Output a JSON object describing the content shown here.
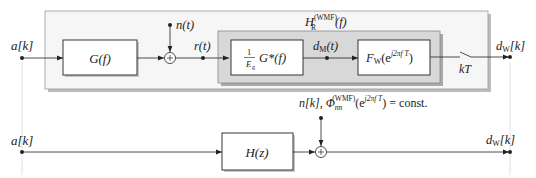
{
  "colors": {
    "line": "#222222",
    "outer_fill": "#f6f6f6",
    "outer_shadow": "#bdbdbd",
    "inner_fill": "#d8d8d8",
    "inner_shadow": "#a9a9a9",
    "block_fill": "#ffffff",
    "guide": "#e4e4e4"
  },
  "top": {
    "input_label": "a[k]",
    "g_block": "G(f)",
    "noise_label": "n(t)",
    "r_label": "r(t)",
    "mf_block": {
      "frac_num": "1",
      "frac_den": "E",
      "frac_den_sub": "g",
      "rest": "G*(f)"
    },
    "dm_label": {
      "main": "d",
      "sub": "M",
      "rest": "(t)"
    },
    "fw_block": {
      "main": "F",
      "sub": "W",
      "rest_open": "(e",
      "sup": "j2πf T",
      "rest_close": ")"
    },
    "hr_label": {
      "main": "H",
      "sub": "R",
      "sup": "(WMF)",
      "rest": "(f)"
    },
    "sampler_label": "kT",
    "output_label": {
      "main": "d",
      "sub": "W",
      "rest": "[k]"
    }
  },
  "bottom": {
    "input_label": "a[k]",
    "h_block": "H(z)",
    "noise_label": {
      "pre": "n[k], Φ",
      "sub": "nn",
      "sup": "(WMF)",
      "mid": "(e",
      "sup2": "j2πf T",
      "post": ") = const."
    },
    "output_label": {
      "main": "d",
      "sub": "W",
      "rest": "[k]"
    }
  }
}
